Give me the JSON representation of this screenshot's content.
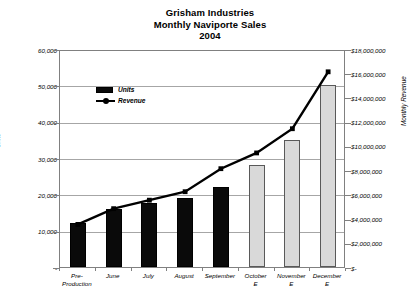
{
  "chart_data": {
    "type": "bar",
    "title": "Grisham Industries Monthly Naviporte Sales 2004",
    "title_lines": [
      "Grisham Industries",
      "Monthly Naviporte Sales",
      "2004"
    ],
    "categories": [
      "Pre-\nProduction",
      "June",
      "July",
      "August",
      "September",
      "October\nE",
      "November\nE",
      "December\nE"
    ],
    "series": [
      {
        "name": "Units",
        "axis": "left",
        "type": "bar",
        "values": [
          12000,
          16000,
          17500,
          19000,
          22000,
          28000,
          35000,
          50000
        ],
        "estimate_flags": [
          false,
          false,
          false,
          false,
          false,
          true,
          true,
          true
        ],
        "color_actual": "#0a0a0a",
        "color_estimate": "#d9d9d9"
      },
      {
        "name": "Revenue",
        "axis": "right",
        "type": "line",
        "values": [
          3600000,
          4900000,
          5600000,
          6300000,
          8200000,
          9500000,
          11500000,
          16200000
        ],
        "color": "#000000"
      }
    ],
    "xlabel": "",
    "ylabel": "Units",
    "ylabel_right": "Monthly Revenue",
    "ylim": [
      0,
      60000
    ],
    "ylim_right": [
      0,
      18000000
    ],
    "ytick_labels_left": [
      "60,000",
      "50,000",
      "40,000",
      "30,000",
      "20,000",
      "10,000",
      "-"
    ],
    "ytick_values_left": [
      60000,
      50000,
      40000,
      30000,
      20000,
      10000,
      0
    ],
    "ytick_labels_right": [
      "$18,000,000",
      "$16,000,000",
      "$14,000,000",
      "$12,000,000",
      "$10,000,000",
      "$8,000,000",
      "$6,000,000",
      "$4,000,000",
      "$2,000,000",
      "$-"
    ],
    "ytick_values_right": [
      18000000,
      16000000,
      14000000,
      12000000,
      10000000,
      8000000,
      6000000,
      4000000,
      2000000,
      0
    ],
    "grid": true,
    "grid_axis": "y-left",
    "legend": [
      {
        "label": "Units",
        "marker": "bar"
      },
      {
        "label": "Revenue",
        "marker": "line"
      }
    ],
    "legend_position": "inside-top-left"
  }
}
